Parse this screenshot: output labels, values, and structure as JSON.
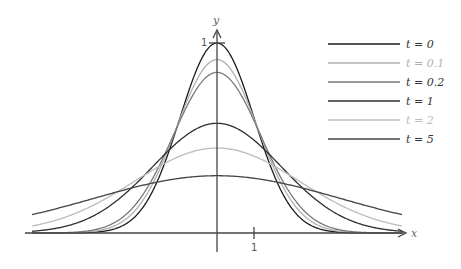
{
  "chart_data": {
    "type": "line",
    "title": "",
    "xlabel": "x",
    "ylabel": "y",
    "xlim": [
      -5,
      5
    ],
    "ylim": [
      0,
      1
    ],
    "x_ticks": [
      {
        "value": 1,
        "label": "1"
      }
    ],
    "y_ticks": [
      {
        "value": 1,
        "label": "1"
      }
    ],
    "grid": false,
    "legend_position": "upper right",
    "formula": "u(x,t) = (1+2t)^(-1/2) * exp(-x^2 / (2(1+2t)))",
    "series": [
      {
        "name": "t = 0",
        "t": 0,
        "color": "#1a1a1a",
        "peak": 1.0,
        "values_at_x": {
          "-5": 0.0,
          "-2": 0.135,
          "-1": 0.607,
          "0": 1.0,
          "1": 0.607,
          "2": 0.135,
          "5": 0.0
        }
      },
      {
        "name": "t = 0.1",
        "t": 0.1,
        "color": "#b0b0b0",
        "peak": 0.913,
        "values_at_x": {
          "-5": 0.0,
          "-2": 0.173,
          "-1": 0.602,
          "0": 0.913,
          "1": 0.602,
          "2": 0.173,
          "5": 0.0
        }
      },
      {
        "name": "t = 0.2",
        "t": 0.2,
        "color": "#7a7a7a",
        "peak": 0.845,
        "values_at_x": {
          "-5": 0.0,
          "-2": 0.201,
          "-1": 0.589,
          "0": 0.845,
          "1": 0.589,
          "2": 0.201,
          "5": 0.0
        }
      },
      {
        "name": "t = 1",
        "t": 1,
        "color": "#2e2e2e",
        "peak": 0.577,
        "values_at_x": {
          "-5": 0.009,
          "-2": 0.296,
          "-1": 0.489,
          "0": 0.577,
          "1": 0.489,
          "2": 0.296,
          "5": 0.009
        }
      },
      {
        "name": "t = 2",
        "t": 2,
        "color": "#bcbcbc",
        "peak": 0.447,
        "values_at_x": {
          "-5": 0.036,
          "-2": 0.3,
          "-1": 0.405,
          "0": 0.447,
          "1": 0.405,
          "2": 0.3,
          "5": 0.036
        }
      },
      {
        "name": "t = 5",
        "t": 5,
        "color": "#444444",
        "peak": 0.302,
        "values_at_x": {
          "-5": 0.097,
          "-2": 0.251,
          "-1": 0.288,
          "0": 0.302,
          "1": 0.288,
          "2": 0.251,
          "5": 0.097
        }
      }
    ]
  },
  "axes": {
    "x_label": "x",
    "y_label": "y",
    "x_tick_label": "1",
    "y_tick_label": "1"
  },
  "legend": [
    {
      "label": "t = 0",
      "color": "#1a1a1a"
    },
    {
      "label": "t = 0.1",
      "color": "#b0b0b0"
    },
    {
      "label": "t = 0.2",
      "color": "#7a7a7a"
    },
    {
      "label": "t = 1",
      "color": "#2e2e2e"
    },
    {
      "label": "t = 2",
      "color": "#bcbcbc"
    },
    {
      "label": "t = 5",
      "color": "#444444"
    }
  ]
}
